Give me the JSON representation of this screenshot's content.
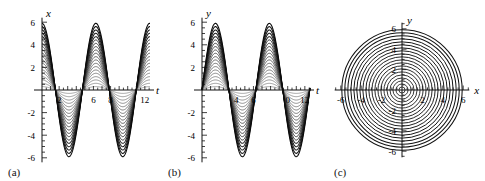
{
  "figure": {
    "panels": [
      {
        "tag": "(a)",
        "xlabel": "t",
        "ylabel": "x",
        "x_ticks": [
          2,
          6,
          8,
          12
        ],
        "x_ticks_all": [
          2,
          4,
          6,
          8,
          10,
          12
        ],
        "y_ticks": [
          6,
          4,
          2,
          -2,
          -4,
          -6
        ]
      },
      {
        "tag": "(b)",
        "xlabel": "t",
        "ylabel": "y",
        "x_ticks": [
          4,
          6,
          0,
          12
        ],
        "x_ticks_all": [
          2,
          4,
          6,
          8,
          10,
          12
        ],
        "y_ticks": [
          6,
          4,
          2,
          -2,
          -4,
          -6
        ]
      },
      {
        "tag": "(c)",
        "xlabel": "x",
        "ylabel": "y",
        "x_ticks": [
          -6,
          -4,
          -2,
          2,
          4,
          6
        ],
        "y_ticks": [
          6,
          4,
          2,
          -2,
          -4,
          -6
        ]
      }
    ]
  },
  "chart_data": [
    {
      "type": "line",
      "title": "",
      "xlabel": "t",
      "ylabel": "x",
      "xlim": [
        0,
        12.6
      ],
      "ylim": [
        -6.4,
        6.4
      ],
      "grid": false,
      "legend": "none",
      "description": "Family of 20 nested sinusoids x = A*cos(t) with amplitudes A from 0.3 to 5.9",
      "x_tick_labels": [
        2,
        6,
        8,
        12
      ],
      "y_tick_labels": [
        6,
        4,
        2,
        -2,
        -4,
        -6
      ],
      "n_curves": 20,
      "amplitudes": [
        0.3,
        0.59,
        0.89,
        1.18,
        1.48,
        1.77,
        2.07,
        2.36,
        2.66,
        2.95,
        3.25,
        3.54,
        3.84,
        4.13,
        4.43,
        4.72,
        5.02,
        5.31,
        5.61,
        5.9
      ],
      "phase": 0.0,
      "period": 6.283,
      "series": [
        {
          "name": "x = A cos(t)",
          "amplitude_min": 0.3,
          "amplitude_max": 5.9
        }
      ]
    },
    {
      "type": "line",
      "title": "",
      "xlabel": "t",
      "ylabel": "y",
      "xlim": [
        0,
        12.6
      ],
      "ylim": [
        -6.4,
        6.4
      ],
      "grid": false,
      "legend": "none",
      "description": "Family of 20 nested sinusoids y = -A*sin(t) with amplitudes A from 0.3 to 5.9",
      "x_tick_labels": [
        4,
        6,
        0,
        12
      ],
      "y_tick_labels": [
        6,
        4,
        2,
        -2,
        -4,
        -6
      ],
      "n_curves": 20,
      "amplitudes": [
        0.3,
        0.59,
        0.89,
        1.18,
        1.48,
        1.77,
        2.07,
        2.36,
        2.66,
        2.95,
        3.25,
        3.54,
        3.84,
        4.13,
        4.43,
        4.72,
        5.02,
        5.31,
        5.61,
        5.9
      ],
      "phase": -1.5708,
      "period": 6.283,
      "series": [
        {
          "name": "y = -A sin(t)",
          "amplitude_min": 0.3,
          "amplitude_max": 5.9
        }
      ]
    },
    {
      "type": "line",
      "title": "",
      "xlabel": "x",
      "ylabel": "y",
      "xlim": [
        -6.4,
        6.4
      ],
      "ylim": [
        -6.4,
        6.4
      ],
      "grid": false,
      "legend": "none",
      "description": "Phase portrait: 20 concentric circles x^2 + y^2 = A^2",
      "x_tick_labels": [
        -6,
        -4,
        -2,
        2,
        4,
        6
      ],
      "y_tick_labels": [
        6,
        4,
        2,
        -2,
        -4,
        -6
      ],
      "n_curves": 20,
      "radii": [
        0.3,
        0.59,
        0.89,
        1.18,
        1.48,
        1.77,
        2.07,
        2.36,
        2.66,
        2.95,
        3.25,
        3.54,
        3.84,
        4.13,
        4.43,
        4.72,
        5.02,
        5.31,
        5.61,
        5.9
      ]
    }
  ]
}
